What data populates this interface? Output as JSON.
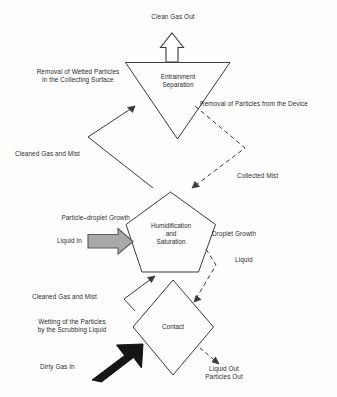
{
  "diagram": {
    "stroke_color": "#3a3a3a",
    "text_color": "#2b2b2b",
    "background_color": "#fefefe",
    "nodes": [
      {
        "id": "entrainment-separation",
        "shape": "inverted-triangle",
        "label": "Entrainment\nSeparation",
        "label_line_1": "Entrainment",
        "label_line_2": "Separation"
      },
      {
        "id": "humidification-and-saturation",
        "shape": "pentagon",
        "label": "Humidification\nand\nSaturation",
        "label_line_1": "Humidification",
        "label_line_2": "and",
        "label_line_3": "Saturation"
      },
      {
        "id": "contact",
        "shape": "diamond",
        "label": "Contact"
      }
    ],
    "flow_labels": {
      "clean_gas_out": "Clean Gas Out",
      "removal_of_wetted_particles": "Removal of Wetted Particles\nin the Collecting Surface",
      "removal_of_wetted_particles_line_1": "Removal of Wetted Particles",
      "removal_of_wetted_particles_line_2": "in the Collecting Surface",
      "removal_of_particles_from_the_device": "Removal of Particles from the Device",
      "cleaned_gas_and_mist_upper": "Cleaned Gas and Mist",
      "collected_mist": "Collected Mist",
      "particle_droplet_growth": "Particle–droplet Growth",
      "liquid_in": "Liquid In",
      "droplet_growth": "Droplet Growth",
      "liquid": "Liquid",
      "cleaned_gas_and_mist_lower": "Cleaned Gas and Mist",
      "wetting_of_the_particles": "Wetting of the Particles\nby the Scrubbing Liquid",
      "wetting_of_the_particles_line_1": "Wetting of the Particles",
      "wetting_of_the_particles_line_2": "by the Scrubbing Liquid",
      "dirty_gas_in": "Dirty Gas In",
      "liquid_out_particles_out": "Liquid Out\nParticles Out",
      "liquid_out": "Liquid Out",
      "particles_out": "Particles Out"
    },
    "arrows": {
      "clean_gas_out": {
        "style": "hollow-block-arrow",
        "direction": "up",
        "fill": "#ffffff",
        "stroke": "#3a3a3a"
      },
      "liquid_in": {
        "style": "filled-block-arrow",
        "direction": "right",
        "fill": "#a9a9a9",
        "stroke": "#5a5a5a"
      },
      "dirty_gas_in": {
        "style": "filled-block-arrow",
        "direction": "up-right",
        "fill": "#1a1a1a",
        "stroke": "#1a1a1a"
      },
      "cleaned_gas_and_mist_upper": {
        "style": "thin-line",
        "direction": "up-right",
        "dashed": false
      },
      "cleaned_gas_and_mist_lower": {
        "style": "thin-line",
        "direction": "up-right",
        "dashed": false
      },
      "removal_of_particles_from_the_device": {
        "style": "thin-line",
        "direction": "down-right-then-down-left",
        "dashed": true
      },
      "liquid_dashed": {
        "style": "thin-line",
        "direction": "down",
        "dashed": true
      },
      "liquid_out_particles_out": {
        "style": "thin-line",
        "direction": "down-right",
        "dashed": true
      }
    }
  }
}
